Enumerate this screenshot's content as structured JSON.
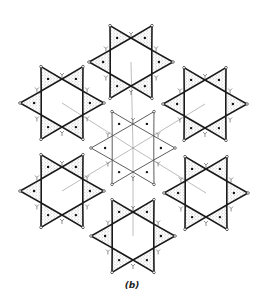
{
  "figure": {
    "caption": "(b)",
    "colors": {
      "background": "#ffffff",
      "outline": "#1a1a1a",
      "stipple": "#9a9a9a",
      "central_outline": "#333333",
      "cation_dot": "#111111"
    },
    "rings": [
      {
        "id": "top",
        "shaded": true,
        "tetrahedra_count": 6
      },
      {
        "id": "upper-left",
        "shaded": true,
        "tetrahedra_count": 6
      },
      {
        "id": "upper-right",
        "shaded": true,
        "tetrahedra_count": 6
      },
      {
        "id": "center",
        "shaded": false,
        "tetrahedra_count": 6
      },
      {
        "id": "lower-left",
        "shaded": true,
        "tetrahedra_count": 6
      },
      {
        "id": "lower-right",
        "shaded": true,
        "tetrahedra_count": 6
      },
      {
        "id": "bottom",
        "shaded": true,
        "tetrahedra_count": 6
      }
    ]
  }
}
